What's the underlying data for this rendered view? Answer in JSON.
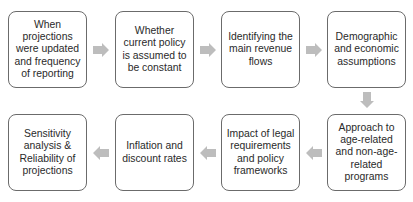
{
  "diagram": {
    "type": "process-flow",
    "steps": [
      {
        "id": 1,
        "label": "When projections were updated and frequency of reporting"
      },
      {
        "id": 2,
        "label": "Whether current policy is assumed to be constant"
      },
      {
        "id": 3,
        "label": "Identifying the main revenue flows"
      },
      {
        "id": 4,
        "label": "Demographic and economic assumptions"
      },
      {
        "id": 5,
        "label": "Approach to age-related and non-age-related programs"
      },
      {
        "id": 6,
        "label": "Impact of legal requirements and policy frameworks"
      },
      {
        "id": 7,
        "label": "Inflation and discount rates"
      },
      {
        "id": 8,
        "label": "Sensitivity analysis & Reliability of projections"
      }
    ],
    "colors": {
      "border": "#6b6b6b",
      "arrow": "#bdbdbd",
      "text": "#2a2a2a"
    }
  }
}
